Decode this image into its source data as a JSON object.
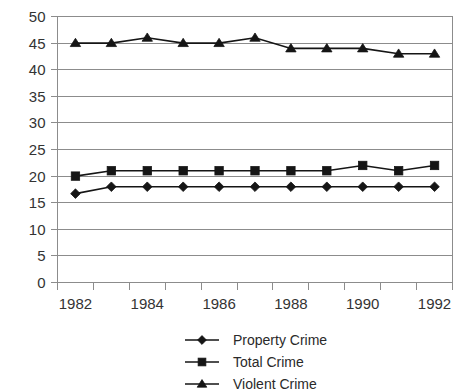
{
  "chart_data": {
    "type": "line",
    "title": "",
    "subtitle": "",
    "xlabel": "",
    "ylabel": "",
    "x": [
      1982,
      1983,
      1984,
      1985,
      1986,
      1987,
      1988,
      1989,
      1990,
      1991,
      1992
    ],
    "categories": [
      "1982",
      "1983",
      "1984",
      "1985",
      "1986",
      "1987",
      "1988",
      "1989",
      "1990",
      "1991",
      "1992"
    ],
    "series": [
      {
        "name": "Property Crime",
        "marker": "diamond",
        "values": [
          16.7,
          18,
          18,
          18,
          18,
          18,
          18,
          18,
          18,
          18,
          18
        ]
      },
      {
        "name": "Total Crime",
        "marker": "square",
        "values": [
          20,
          21,
          21,
          21,
          21,
          21,
          21,
          21,
          22,
          21,
          22
        ]
      },
      {
        "name": "Violent Crime",
        "marker": "triangle",
        "values": [
          45,
          45,
          46,
          45,
          45,
          46,
          44,
          44,
          44,
          43,
          43
        ]
      }
    ],
    "ylim": [
      0,
      50
    ],
    "ytick_step": 5,
    "y_ticks": [
      0,
      5,
      10,
      15,
      20,
      25,
      30,
      35,
      40,
      45,
      50
    ],
    "y_tick_labels": [
      "0",
      "5",
      "10",
      "15",
      "20",
      "25",
      "30",
      "35",
      "40",
      "45",
      "50"
    ],
    "x_tick_labels_shown": [
      "1982",
      "1984",
      "1986",
      "1988",
      "1990",
      "1992"
    ],
    "grid": true,
    "grid_axis": "y",
    "legend_position": "bottom",
    "legend_entries": [
      "Property Crime",
      "Total Crime",
      "Violent Crime"
    ],
    "colors": {
      "series": "#151515",
      "grid": "#8c8c8c",
      "axis": "#8c8c8c",
      "text": "#333333",
      "background": "#ffffff"
    }
  }
}
